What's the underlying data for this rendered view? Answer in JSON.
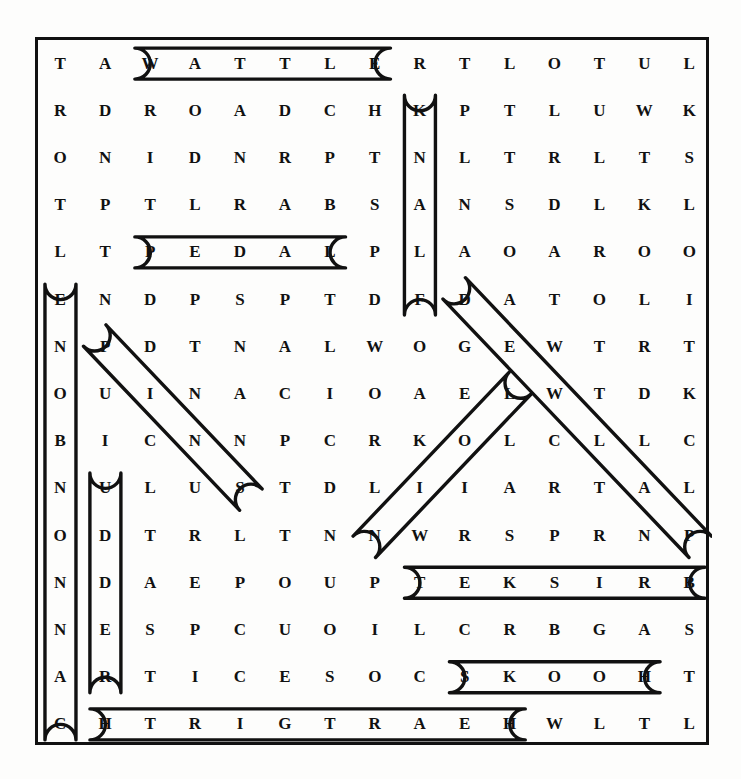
{
  "puzzle": {
    "type": "word-search",
    "rows": 15,
    "cols": 15,
    "ink_color": "#111111",
    "paper_color": "#fdfdfc",
    "grid": [
      [
        "T",
        "A",
        "W",
        "A",
        "T",
        "T",
        "L",
        "E",
        "R",
        "T",
        "L",
        "O",
        "T",
        "U",
        "L"
      ],
      [
        "R",
        "D",
        "R",
        "O",
        "A",
        "D",
        "C",
        "H",
        "K",
        "P",
        "T",
        "L",
        "U",
        "W",
        "K"
      ],
      [
        "O",
        "N",
        "I",
        "D",
        "N",
        "R",
        "P",
        "T",
        "N",
        "L",
        "T",
        "R",
        "L",
        "T",
        "S"
      ],
      [
        "T",
        "P",
        "T",
        "L",
        "R",
        "A",
        "B",
        "S",
        "A",
        "N",
        "S",
        "D",
        "L",
        "K",
        "L"
      ],
      [
        "L",
        "T",
        "P",
        "E",
        "D",
        "A",
        "L",
        "P",
        "L",
        "A",
        "O",
        "A",
        "R",
        "O",
        "O"
      ],
      [
        "E",
        "N",
        "D",
        "P",
        "S",
        "P",
        "T",
        "D",
        "F",
        "D",
        "A",
        "T",
        "O",
        "L",
        "I"
      ],
      [
        "N",
        "P",
        "D",
        "T",
        "N",
        "A",
        "L",
        "W",
        "O",
        "G",
        "E",
        "W",
        "T",
        "R",
        "T"
      ],
      [
        "O",
        "U",
        "I",
        "N",
        "A",
        "C",
        "I",
        "O",
        "A",
        "E",
        "L",
        "W",
        "T",
        "D",
        "K"
      ],
      [
        "B",
        "I",
        "C",
        "N",
        "N",
        "P",
        "C",
        "R",
        "K",
        "O",
        "L",
        "C",
        "L",
        "L",
        "C"
      ],
      [
        "N",
        "U",
        "L",
        "U",
        "S",
        "T",
        "D",
        "L",
        "I",
        "I",
        "A",
        "R",
        "T",
        "A",
        "L"
      ],
      [
        "O",
        "D",
        "T",
        "R",
        "L",
        "T",
        "N",
        "N",
        "W",
        "R",
        "S",
        "P",
        "R",
        "N",
        "P"
      ],
      [
        "N",
        "D",
        "A",
        "E",
        "P",
        "O",
        "U",
        "P",
        "T",
        "E",
        "K",
        "S",
        "I",
        "R",
        "B"
      ],
      [
        "N",
        "E",
        "S",
        "P",
        "C",
        "U",
        "O",
        "I",
        "L",
        "C",
        "R",
        "B",
        "G",
        "A",
        "S"
      ],
      [
        "A",
        "R",
        "T",
        "I",
        "C",
        "E",
        "S",
        "O",
        "C",
        "S",
        "K",
        "O",
        "O",
        "H",
        "T"
      ],
      [
        "C",
        "H",
        "T",
        "R",
        "I",
        "G",
        "T",
        "R",
        "A",
        "E",
        "H",
        "W",
        "L",
        "T",
        "L"
      ]
    ],
    "found_words": [
      {
        "name": "wattle",
        "text": "WATTLE",
        "direction": "horizontal",
        "start": [
          0,
          2
        ],
        "end": [
          0,
          7
        ]
      },
      {
        "name": "pedal",
        "text": "PEDAL",
        "direction": "horizontal",
        "start": [
          4,
          2
        ],
        "end": [
          4,
          6
        ]
      },
      {
        "name": "flank-reversed",
        "text": "KNALF",
        "direction": "vertical",
        "start": [
          1,
          8
        ],
        "end": [
          5,
          8
        ]
      },
      {
        "name": "cannonbone-reversed",
        "text": "ENOBNONNAC",
        "direction": "vertical",
        "start": [
          5,
          0
        ],
        "end": [
          14,
          0
        ]
      },
      {
        "name": "udder",
        "text": "UDDER",
        "direction": "vertical",
        "start": [
          9,
          1
        ],
        "end": [
          13,
          1
        ]
      },
      {
        "name": "pins",
        "text": "PINS",
        "direction": "diagonal-down-right",
        "start": [
          6,
          1
        ],
        "end": [
          9,
          4
        ]
      },
      {
        "name": "dewlap",
        "text": "DEWLAP",
        "direction": "diagonal-down-right",
        "start": [
          5,
          9
        ],
        "end": [
          10,
          14
        ]
      },
      {
        "name": "loin-reversed",
        "text": "NIOL",
        "direction": "diagonal-up-right",
        "start": [
          10,
          7
        ],
        "end": [
          7,
          10
        ]
      },
      {
        "name": "brisket-reversed",
        "text": "TEKSIRB",
        "direction": "horizontal",
        "start": [
          11,
          8
        ],
        "end": [
          11,
          14
        ]
      },
      {
        "name": "hooks-reversed",
        "text": "SKOOH",
        "direction": "horizontal",
        "start": [
          13,
          9
        ],
        "end": [
          13,
          13
        ]
      },
      {
        "name": "heartgirth-reversed",
        "text": "HTRIGTRAEH",
        "direction": "horizontal",
        "start": [
          14,
          1
        ],
        "end": [
          14,
          10
        ]
      }
    ]
  }
}
